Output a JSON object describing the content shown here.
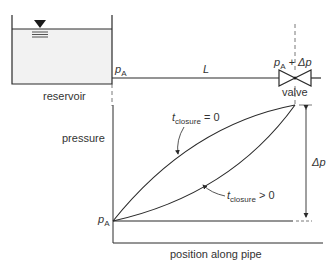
{
  "diagram": {
    "reservoir_label": "reservoir",
    "pipe_entrance_pressure": {
      "symbol": "p",
      "subscript": "A"
    },
    "pipe_length_label": "L",
    "valve_pressure": {
      "symbol": "p",
      "subscript": "A",
      "suffix": " + Δp"
    },
    "valve_label": "valve",
    "graph": {
      "y_axis_label": "pressure",
      "x_axis_label": "position along pipe",
      "origin_label": {
        "symbol": "p",
        "subscript": "A"
      },
      "delta_label": "Δp",
      "curve_instant": {
        "t": "t",
        "subscript": "closure",
        "relation": " = 0"
      },
      "curve_gradual": {
        "t": "t",
        "subscript": "closure",
        "relation": " > 0"
      }
    },
    "icons": {
      "water_level": "inverted-triangle-water-surface-icon",
      "valve": "gate-valve-bowtie-icon"
    }
  }
}
